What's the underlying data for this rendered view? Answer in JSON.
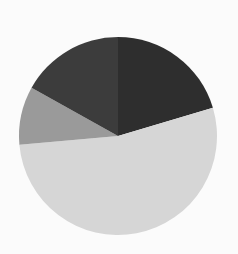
{
  "chart_data": {
    "type": "pie",
    "title": "",
    "start_angle_deg": 0,
    "direction": "clockwise",
    "slices": [
      {
        "label": "",
        "value": 20.4,
        "color": "#2e2e2e"
      },
      {
        "label": "",
        "value": 53.2,
        "color": "#d6d6d6"
      },
      {
        "label": "",
        "value": 9.5,
        "color": "#9a9a9a"
      },
      {
        "label": "",
        "value": 16.9,
        "color": "#3c3c3c"
      }
    ],
    "values": [
      20.4,
      53.2,
      9.5,
      16.9
    ],
    "legend": "none",
    "data_labels": "none"
  },
  "layout": {
    "center_x": 118,
    "center_y": 136,
    "radius": 99,
    "background": "#fbfbfb"
  }
}
